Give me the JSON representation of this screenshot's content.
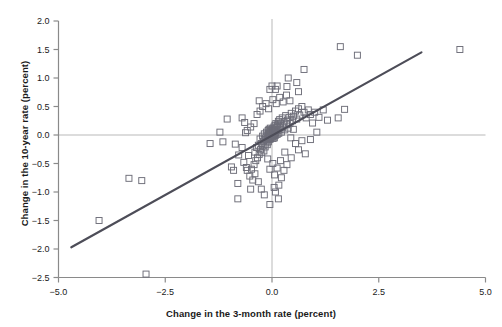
{
  "chart_data": {
    "type": "scatter",
    "title": "",
    "xlabel": "Change in the 3-month rate (percent)",
    "ylabel": "Change in the 10-year rate (percent)",
    "xlim": [
      -5.0,
      5.0
    ],
    "ylim": [
      -2.5,
      2.0
    ],
    "xticks": [
      -5.0,
      -2.5,
      0.0,
      2.5,
      5.0
    ],
    "xticklabels": [
      "-5.0",
      "-2.5",
      "0.0",
      "2.5",
      "5.0"
    ],
    "yticks": [
      -2.5,
      -2.0,
      -1.5,
      -1.0,
      -0.5,
      0.0,
      0.5,
      1.0,
      1.5,
      2.0
    ],
    "yticklabels": [
      "-2.5",
      "-2.0",
      "-1.5",
      "-1.0",
      "-0.5",
      "0.0",
      "0.5",
      "1.0",
      "1.5",
      "2.0"
    ],
    "grid": false,
    "zero_lines": {
      "horizontal": 0.0,
      "vertical": 0.0,
      "color": "#b9b9b9"
    },
    "legend": null,
    "marker": {
      "shape": "square",
      "filled": false,
      "edge_color": "#6d6d78",
      "size_px": 6
    },
    "trendline": {
      "type": "linear-fit",
      "color": "#4d4d58",
      "width_px": 2.2,
      "x_start": -4.7,
      "y_start": -1.97,
      "x_end": 3.5,
      "y_end": 1.45,
      "slope": 0.417,
      "intercept": -0.011
    },
    "series": [
      {
        "name": "observations",
        "points": [
          [
            -3.35,
            -0.76
          ],
          [
            -3.05,
            -0.8
          ],
          [
            -4.05,
            -1.5
          ],
          [
            -2.95,
            -2.44
          ],
          [
            -1.45,
            -0.15
          ],
          [
            -0.8,
            -0.85
          ],
          [
            -0.8,
            -1.12
          ],
          [
            -1.05,
            0.28
          ],
          [
            -0.7,
            0.3
          ],
          [
            -0.66,
            -0.48
          ],
          [
            -0.6,
            -0.57
          ],
          [
            -0.58,
            -0.62
          ],
          [
            -0.55,
            -0.36
          ],
          [
            -0.52,
            -0.72
          ],
          [
            -0.5,
            -0.95
          ],
          [
            -0.48,
            -0.6
          ],
          [
            -0.45,
            -0.79
          ],
          [
            -0.42,
            -0.52
          ],
          [
            -0.4,
            -0.3
          ],
          [
            -0.38,
            -0.45
          ],
          [
            -0.95,
            -0.56
          ],
          [
            -0.9,
            -0.62
          ],
          [
            -1.22,
            0.05
          ],
          [
            -1.15,
            -0.12
          ],
          [
            -0.36,
            -0.22
          ],
          [
            -0.34,
            -0.4
          ],
          [
            -0.32,
            -0.18
          ],
          [
            -0.3,
            -0.34
          ],
          [
            -0.28,
            -0.07
          ],
          [
            -0.27,
            -0.26
          ],
          [
            -0.25,
            -0.15
          ],
          [
            -0.24,
            -0.31
          ],
          [
            -0.22,
            -0.02
          ],
          [
            -0.21,
            -0.19
          ],
          [
            -0.2,
            -0.11
          ],
          [
            -0.19,
            -0.28
          ],
          [
            -0.18,
            0.02
          ],
          [
            -0.17,
            -0.08
          ],
          [
            -0.16,
            -0.21
          ],
          [
            -0.15,
            -0.05
          ],
          [
            -0.14,
            -0.14
          ],
          [
            -0.13,
            0.05
          ],
          [
            -0.12,
            -0.09
          ],
          [
            -0.11,
            -0.17
          ],
          [
            -0.1,
            0.0
          ],
          [
            -0.095,
            -0.06
          ],
          [
            -0.09,
            0.08
          ],
          [
            -0.085,
            -0.12
          ],
          [
            -0.08,
            0.03
          ],
          [
            -0.075,
            -0.03
          ],
          [
            -0.07,
            0.1
          ],
          [
            -0.065,
            -0.08
          ],
          [
            -0.06,
            0.01
          ],
          [
            -0.055,
            -0.05
          ],
          [
            -0.05,
            0.06
          ],
          [
            -0.045,
            -0.02
          ],
          [
            -0.04,
            0.12
          ],
          [
            -0.035,
            -0.07
          ],
          [
            -0.03,
            0.04
          ],
          [
            -0.025,
            -0.01
          ],
          [
            -0.02,
            0.09
          ],
          [
            -0.015,
            -0.04
          ],
          [
            -0.01,
            0.02
          ],
          [
            -0.005,
            0.07
          ],
          [
            0.0,
            0.0
          ],
          [
            0.005,
            0.05
          ],
          [
            0.01,
            -0.03
          ],
          [
            0.015,
            0.11
          ],
          [
            0.02,
            0.01
          ],
          [
            0.025,
            -0.06
          ],
          [
            0.03,
            0.08
          ],
          [
            0.035,
            0.03
          ],
          [
            0.04,
            -0.02
          ],
          [
            0.045,
            0.14
          ],
          [
            0.05,
            0.06
          ],
          [
            0.055,
            -0.05
          ],
          [
            0.06,
            0.1
          ],
          [
            0.065,
            0.02
          ],
          [
            0.07,
            0.17
          ],
          [
            0.075,
            -0.01
          ],
          [
            0.08,
            0.09
          ],
          [
            0.085,
            0.04
          ],
          [
            0.09,
            0.2
          ],
          [
            0.1,
            0.07
          ],
          [
            0.11,
            0.13
          ],
          [
            0.12,
            0.01
          ],
          [
            0.13,
            0.18
          ],
          [
            0.14,
            0.08
          ],
          [
            0.15,
            0.24
          ],
          [
            0.16,
            0.03
          ],
          [
            0.17,
            0.15
          ],
          [
            0.18,
            0.27
          ],
          [
            0.19,
            0.1
          ],
          [
            0.2,
            0.21
          ],
          [
            0.22,
            0.05
          ],
          [
            0.24,
            0.3
          ],
          [
            0.26,
            0.14
          ],
          [
            0.28,
            0.23
          ],
          [
            0.3,
            0.09
          ],
          [
            0.32,
            0.34
          ],
          [
            0.34,
            0.18
          ],
          [
            0.36,
            0.26
          ],
          [
            0.38,
            0.12
          ],
          [
            0.4,
            0.31
          ],
          [
            0.42,
            0.2
          ],
          [
            0.45,
            0.38
          ],
          [
            0.48,
            0.25
          ],
          [
            0.5,
            0.33
          ],
          [
            0.55,
            0.42
          ],
          [
            0.58,
            0.28
          ],
          [
            0.62,
            0.46
          ],
          [
            0.65,
            0.35
          ],
          [
            0.7,
            0.5
          ],
          [
            0.75,
            0.4
          ],
          [
            0.8,
            0.3
          ],
          [
            0.85,
            0.44
          ],
          [
            0.9,
            0.36
          ],
          [
            0.95,
            0.21
          ],
          [
            1.0,
            0.4
          ],
          [
            1.1,
            0.31
          ],
          [
            1.2,
            0.44
          ],
          [
            1.3,
            0.26
          ],
          [
            1.55,
            0.3
          ],
          [
            1.7,
            0.45
          ],
          [
            -0.42,
            0.2
          ],
          [
            -0.5,
            0.14
          ],
          [
            -0.58,
            0.08
          ],
          [
            -0.64,
            0.22
          ],
          [
            -0.35,
            0.36
          ],
          [
            -0.28,
            0.42
          ],
          [
            -0.22,
            0.5
          ],
          [
            -0.3,
            0.6
          ],
          [
            -0.14,
            0.55
          ],
          [
            -0.08,
            0.46
          ],
          [
            0.02,
            0.62
          ],
          [
            0.1,
            0.55
          ],
          [
            0.18,
            0.66
          ],
          [
            0.26,
            0.58
          ],
          [
            0.34,
            0.7
          ],
          [
            0.42,
            0.6
          ],
          [
            0.08,
            0.8
          ],
          [
            0.12,
            0.86
          ],
          [
            0.35,
            0.85
          ],
          [
            0.38,
            1.0
          ],
          [
            0.75,
            1.15
          ],
          [
            0.58,
            0.92
          ],
          [
            0.62,
            0.76
          ],
          [
            0.0,
            0.86
          ],
          [
            -0.05,
            0.8
          ],
          [
            1.6,
            1.55
          ],
          [
            2.0,
            1.4
          ],
          [
            4.4,
            1.5
          ],
          [
            0.55,
            -0.15
          ],
          [
            0.62,
            -0.26
          ],
          [
            0.7,
            -0.1
          ],
          [
            0.78,
            -0.33
          ],
          [
            0.45,
            -0.4
          ],
          [
            0.35,
            -0.52
          ],
          [
            0.28,
            -0.62
          ],
          [
            0.22,
            -0.75
          ],
          [
            0.16,
            -0.88
          ],
          [
            0.3,
            -0.3
          ],
          [
            0.2,
            -0.45
          ],
          [
            0.12,
            -0.58
          ],
          [
            0.06,
            -0.7
          ],
          [
            0.02,
            -0.5
          ],
          [
            -0.05,
            -0.6
          ],
          [
            -0.1,
            -0.42
          ],
          [
            0.5,
            0.1
          ],
          [
            0.44,
            -0.05
          ],
          [
            0.9,
            -0.08
          ],
          [
            1.05,
            0.05
          ],
          [
            -0.62,
            0.04
          ],
          [
            -0.7,
            -0.22
          ],
          [
            -0.78,
            -0.35
          ],
          [
            -0.86,
            -0.16
          ],
          [
            -0.4,
            -0.68
          ],
          [
            -0.32,
            -0.82
          ],
          [
            -0.25,
            -0.95
          ],
          [
            -0.18,
            -1.05
          ],
          [
            0.08,
            -1.0
          ],
          [
            0.15,
            -1.12
          ],
          [
            -0.05,
            -1.22
          ],
          [
            0.05,
            -0.92
          ]
        ]
      }
    ]
  },
  "axes": {
    "x_axis_name": "x-axis",
    "y_axis_name": "y-axis"
  }
}
